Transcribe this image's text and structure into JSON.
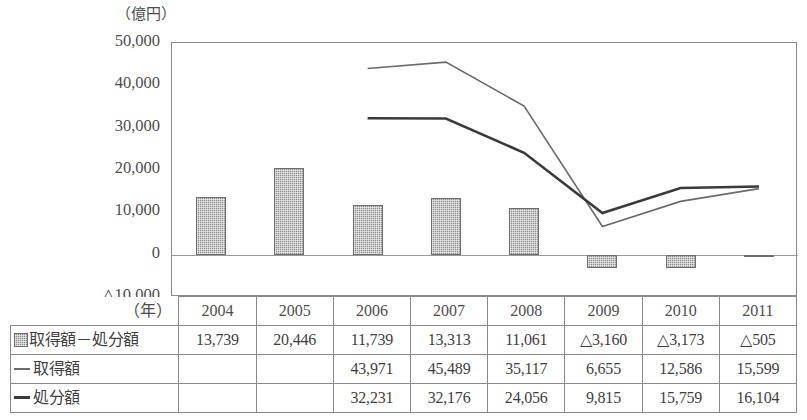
{
  "unit_label": "（億円）",
  "axis": {
    "year_axis_label": "（年）",
    "y_ticks": [
      "50,000",
      "40,000",
      "30,000",
      "20,000",
      "10,000",
      "0",
      "△10,000"
    ],
    "y_tick_values": [
      50000,
      40000,
      30000,
      20000,
      10000,
      0,
      -10000
    ]
  },
  "legend": {
    "bar_series_label": "取得額－処分額",
    "line1_series_label": "取得額",
    "line2_series_label": "処分額",
    "bar_swatch_icon": "gray-hatched-square-icon",
    "line1_swatch_icon": "thin-gray-line-icon",
    "line2_swatch_icon": "thick-black-line-icon",
    "bar_color": "#8d8d8d",
    "line1_color": "#6b6b6b",
    "line2_color": "#3a3a3a"
  },
  "chart_data": {
    "type": "bar",
    "title": "",
    "subtitle": "",
    "xlabel": "（年）",
    "ylabel": "（億円）",
    "ylim": [
      -10000,
      50000
    ],
    "grid": false,
    "legend_position": "table-below",
    "categories": [
      "2004",
      "2005",
      "2006",
      "2007",
      "2008",
      "2009",
      "2010",
      "2011"
    ],
    "series": [
      {
        "name": "取得額－処分額",
        "type": "bar",
        "color": "#8d8d8d",
        "values": [
          13739,
          20446,
          11739,
          13313,
          11061,
          -3160,
          -3173,
          -505
        ],
        "labels": [
          "13,739",
          "20,446",
          "11,739",
          "13,313",
          "11,061",
          "△3,160",
          "△3,173",
          "△505"
        ]
      },
      {
        "name": "取得額",
        "type": "line",
        "color": "#6b6b6b",
        "values": [
          null,
          null,
          43971,
          45489,
          35117,
          6655,
          12586,
          15599
        ],
        "labels": [
          "",
          "",
          "43,971",
          "45,489",
          "35,117",
          "6,655",
          "12,586",
          "15,599"
        ]
      },
      {
        "name": "処分額",
        "type": "line",
        "color": "#3a3a3a",
        "values": [
          null,
          null,
          32231,
          32176,
          24056,
          9815,
          15759,
          16104
        ],
        "labels": [
          "",
          "",
          "32,231",
          "32,176",
          "24,056",
          "9,815",
          "15,759",
          "16,104"
        ]
      }
    ]
  },
  "table": {
    "header_corner": "（年）",
    "columns": [
      "2004",
      "2005",
      "2006",
      "2007",
      "2008",
      "2009",
      "2010",
      "2011"
    ],
    "rows": [
      {
        "label": "取得額－処分額",
        "marker": "bar",
        "cells": [
          "13,739",
          "20,446",
          "11,739",
          "13,313",
          "11,061",
          "△3,160",
          "△3,173",
          "△505"
        ]
      },
      {
        "label": "取得額",
        "marker": "thin-line",
        "cells": [
          "",
          "",
          "43,971",
          "45,489",
          "35,117",
          "6,655",
          "12,586",
          "15,599"
        ]
      },
      {
        "label": "処分額",
        "marker": "thick-line",
        "cells": [
          "",
          "",
          "32,231",
          "32,176",
          "24,056",
          "9,815",
          "15,759",
          "16,104"
        ]
      }
    ]
  }
}
